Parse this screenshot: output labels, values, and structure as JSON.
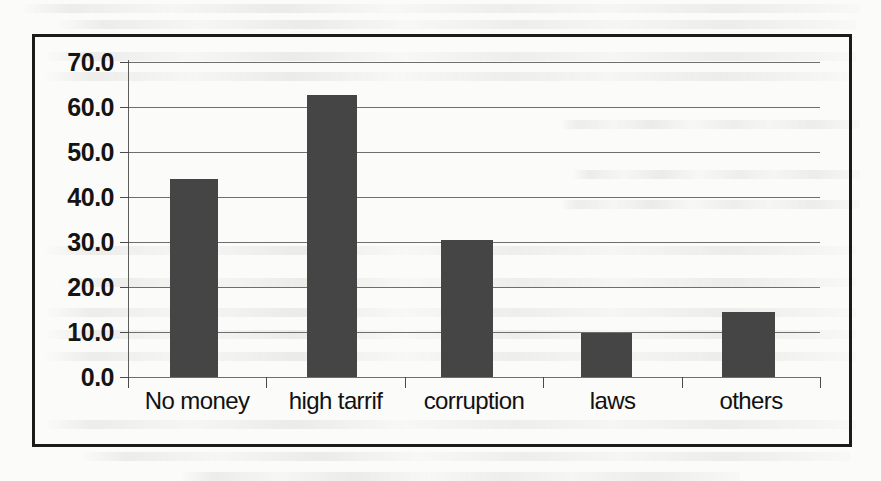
{
  "chart_data": {
    "type": "bar",
    "title": "",
    "subtitle": "",
    "xlabel": "",
    "ylabel": "",
    "categories": [
      "No money",
      "high tarrif",
      "corruption",
      "laws",
      "others"
    ],
    "values": [
      44.0,
      62.7,
      30.4,
      9.7,
      14.5
    ],
    "series": [
      {
        "name": "",
        "values": [
          44.0,
          62.7,
          30.4,
          9.7,
          14.5
        ]
      }
    ],
    "ylim": [
      0.0,
      70.0
    ],
    "ytick_step": 10.0,
    "ytick_labels": [
      "70.0",
      "60.0",
      "50.0",
      "40.0",
      "30.0",
      "20.0",
      "10.0",
      "0.0"
    ],
    "ytick_values": [
      70.0,
      60.0,
      50.0,
      40.0,
      30.0,
      20.0,
      10.0,
      0.0
    ],
    "grid": true,
    "grid_axis": "y",
    "legend": false,
    "legend_position": "none",
    "annotations": [],
    "bar_color": "#454545",
    "gridline_color": "#6e6e6e",
    "axis_color": "#4a4a4a",
    "frame_color": "#1b1b1b",
    "background_color": "#fbfbf9"
  }
}
